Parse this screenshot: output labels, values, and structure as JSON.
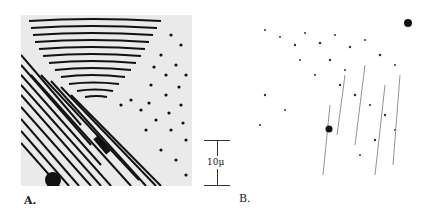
{
  "figure": {
    "panels": [
      {
        "id": "A",
        "label": "A.",
        "description": "Micrograph showing lamellar and dotted eutectic-like structure"
      },
      {
        "id": "B",
        "label": "B.",
        "description": "Micrograph showing sparse dark particles on light background"
      }
    ],
    "scale_bar": {
      "label": "10μ"
    }
  }
}
